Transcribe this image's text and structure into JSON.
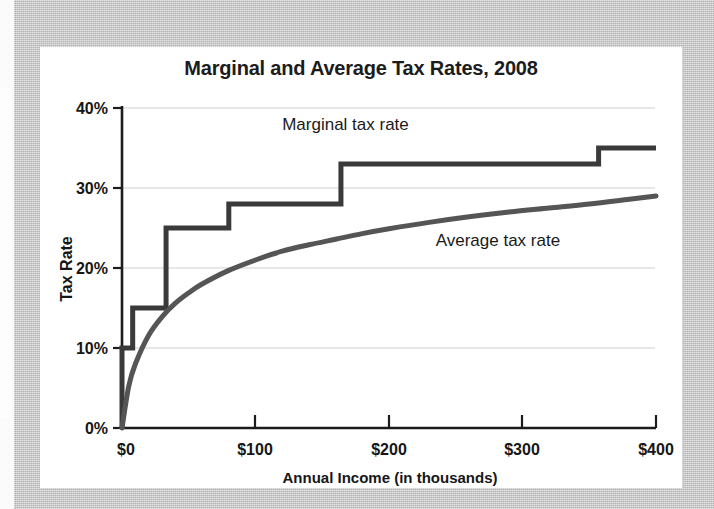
{
  "card": {
    "background_color": "#ffffff",
    "page_background_color": "#c7c7c7"
  },
  "chart_data": {
    "type": "line",
    "title": "Marginal and Average Tax Rates, 2008",
    "xlabel": "Annual Income (in thousands)",
    "ylabel": "Tax Rate",
    "xlim": [
      0,
      430
    ],
    "ylim": [
      0,
      40
    ],
    "grid": true,
    "grid_axis": "y",
    "grid_color": "#cfcfcf",
    "legend_position": "inline-annotations",
    "line_color": "#3a3a3a",
    "xticks": [
      0,
      100,
      200,
      300,
      400
    ],
    "xtick_labels": [
      "$0",
      "$100",
      "$200",
      "$300",
      "$400"
    ],
    "yticks": [
      0,
      10,
      20,
      30,
      40
    ],
    "ytick_labels": [
      "0%",
      "10%",
      "20%",
      "30%",
      "40%"
    ],
    "annotations": [
      {
        "text": "Marginal tax rate",
        "x": 120,
        "y": 37.2
      },
      {
        "text": "Average tax rate",
        "x": 235,
        "y": 22.8
      }
    ],
    "series": [
      {
        "name": "Marginal tax rate",
        "type": "step",
        "brackets": [
          {
            "income_start": 0,
            "income_end": 8,
            "rate": 10
          },
          {
            "income_start": 8,
            "income_end": 33,
            "rate": 15
          },
          {
            "income_start": 33,
            "income_end": 80,
            "rate": 25
          },
          {
            "income_start": 80,
            "income_end": 164,
            "rate": 28
          },
          {
            "income_start": 164,
            "income_end": 357,
            "rate": 33
          },
          {
            "income_start": 357,
            "income_end": 400,
            "rate": 35
          }
        ],
        "x": [
          0,
          8,
          8,
          33,
          33,
          80,
          80,
          164,
          164,
          357,
          357,
          400
        ],
        "values": [
          10,
          10,
          15,
          15,
          25,
          25,
          28,
          28,
          33,
          33,
          35,
          35
        ]
      },
      {
        "name": "Average tax rate",
        "type": "curve",
        "x": [
          0,
          5,
          10,
          20,
          30,
          40,
          50,
          60,
          80,
          100,
          120,
          140,
          160,
          180,
          200,
          230,
          260,
          290,
          320,
          350,
          380,
          400
        ],
        "values": [
          0,
          5.2,
          8.0,
          11.6,
          13.9,
          15.6,
          16.9,
          18.0,
          19.7,
          21.0,
          22.1,
          22.9,
          23.6,
          24.3,
          24.9,
          25.7,
          26.4,
          27.0,
          27.5,
          28.0,
          28.6,
          29.0
        ]
      }
    ]
  }
}
